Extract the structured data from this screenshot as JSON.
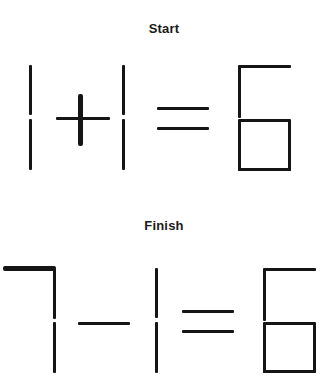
{
  "page": {
    "background_color": "#ffffff",
    "stick_color": "#151515",
    "width": 328,
    "height": 381
  },
  "sections": [
    {
      "id": "start",
      "label": "Start",
      "equation_text": "1 + 1 = 6",
      "glyphs": [
        {
          "name": "digit-one-left",
          "value": "1",
          "sticks": 2
        },
        {
          "name": "operator-plus",
          "value": "+",
          "sticks": 2
        },
        {
          "name": "digit-one-right",
          "value": "1",
          "sticks": 2
        },
        {
          "name": "operator-equals",
          "value": "=",
          "sticks": 2
        },
        {
          "name": "digit-six",
          "value": "6",
          "sticks": 6
        }
      ]
    },
    {
      "id": "finish",
      "label": "Finish",
      "equation_text": "7 - 1 = 6",
      "glyphs": [
        {
          "name": "digit-seven",
          "value": "7",
          "sticks": 3
        },
        {
          "name": "operator-minus",
          "value": "-",
          "sticks": 1
        },
        {
          "name": "digit-one",
          "value": "1",
          "sticks": 2
        },
        {
          "name": "operator-equals",
          "value": "=",
          "sticks": 2
        },
        {
          "name": "digit-six",
          "value": "6",
          "sticks": 6
        }
      ]
    }
  ]
}
